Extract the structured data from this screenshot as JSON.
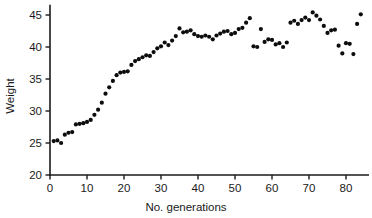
{
  "chart_data": {
    "type": "scatter",
    "title": "",
    "xlabel": "No. generations",
    "ylabel": "Weight",
    "xlim": [
      0,
      86
    ],
    "ylim": [
      20,
      46
    ],
    "xticks": [
      0,
      10,
      20,
      30,
      40,
      50,
      60,
      70,
      80
    ],
    "yticks": [
      20,
      25,
      30,
      35,
      40,
      45
    ],
    "xtick_labels": [
      "0",
      "10",
      "20",
      "30",
      "40",
      "50",
      "60",
      "70",
      "80"
    ],
    "ytick_labels": [
      "20",
      "25",
      "30",
      "35",
      "40",
      "45"
    ],
    "grid": false,
    "legend": null,
    "marker": "filled-circle",
    "marker_color": "#0d0d0d",
    "marker_size_px": 3.1,
    "x": [
      1,
      2,
      3,
      4,
      5,
      6,
      7,
      8,
      9,
      10,
      11,
      12,
      13,
      14,
      15,
      16,
      17,
      18,
      19,
      20,
      21,
      22,
      23,
      24,
      25,
      26,
      27,
      28,
      29,
      30,
      31,
      32,
      33,
      34,
      35,
      36,
      37,
      38,
      39,
      40,
      41,
      42,
      43,
      44,
      45,
      46,
      47,
      48,
      49,
      50,
      51,
      52,
      53,
      54,
      55,
      56,
      57,
      58,
      59,
      60,
      61,
      62,
      63,
      64,
      65,
      66,
      67,
      68,
      69,
      70,
      71,
      72,
      73,
      74,
      75,
      76,
      77,
      78,
      79,
      80,
      81,
      82,
      83,
      84
    ],
    "y": [
      25.3,
      25.4,
      25.0,
      26.3,
      26.6,
      26.7,
      27.9,
      28.0,
      28.1,
      28.3,
      28.6,
      29.4,
      30.2,
      31.3,
      32.7,
      33.7,
      34.7,
      35.6,
      36.0,
      36.1,
      36.2,
      37.2,
      37.8,
      38.1,
      38.4,
      38.7,
      38.6,
      39.2,
      39.8,
      40.1,
      40.7,
      40.3,
      41.0,
      41.7,
      42.9,
      42.3,
      42.4,
      42.6,
      42.0,
      41.7,
      41.6,
      41.8,
      41.6,
      41.2,
      41.8,
      42.1,
      42.4,
      42.5,
      42.0,
      42.2,
      42.8,
      43.0,
      43.8,
      44.5,
      40.1,
      40.0,
      42.8,
      40.8,
      41.2,
      41.1,
      40.4,
      40.6,
      40.0,
      40.7,
      43.8,
      44.1,
      43.6,
      44.2,
      44.6,
      44.2,
      45.4,
      44.9,
      44.3,
      43.3,
      42.2,
      42.6,
      42.7,
      40.2,
      39.0,
      40.6,
      40.5,
      38.9,
      43.6,
      45.1
    ]
  }
}
